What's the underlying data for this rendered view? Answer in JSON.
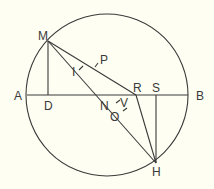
{
  "diagram": {
    "type": "geometry-circle-construction",
    "colors": {
      "background": "#fefef2",
      "ink": "#3a3a3a"
    },
    "circle": {
      "cx": 107,
      "cy": 95,
      "r": 81
    },
    "points": {
      "A": {
        "label": "A",
        "x": 27,
        "y": 95
      },
      "B": {
        "label": "B",
        "x": 188,
        "y": 95
      },
      "M": {
        "label": "M",
        "x": 48,
        "y": 41
      },
      "D": {
        "label": "D",
        "x": 48,
        "y": 95
      },
      "N": {
        "label": "N",
        "x": 113,
        "y": 95
      },
      "R": {
        "label": "R",
        "x": 136,
        "y": 95
      },
      "S": {
        "label": "S",
        "x": 156,
        "y": 95
      },
      "H": {
        "label": "H",
        "x": 156,
        "y": 163
      },
      "P": {
        "label": "P",
        "x": 97,
        "y": 66
      },
      "I": {
        "label": "I",
        "x": 82,
        "y": 71
      },
      "V": {
        "label": "V",
        "x": 122,
        "y": 104
      },
      "O": {
        "label": "O",
        "x": 125,
        "y": 112
      }
    },
    "segments": [
      "A-B",
      "M-D",
      "M-H",
      "M-R",
      "R-H",
      "S-H"
    ]
  }
}
